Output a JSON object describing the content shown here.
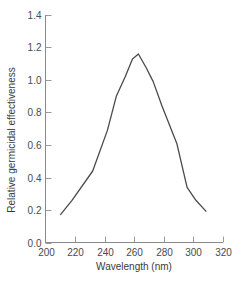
{
  "chart_data": {
    "type": "line",
    "title": "",
    "xlabel": "Wavelength (nm)",
    "ylabel": "Relative germicidal effectiveness",
    "xlim": [
      200,
      320
    ],
    "ylim": [
      0.0,
      1.4
    ],
    "x_ticks": [
      200,
      220,
      240,
      260,
      280,
      300,
      320
    ],
    "x_tick_labels": [
      "200",
      "220",
      "240",
      "260",
      "280",
      "300",
      "320"
    ],
    "y_ticks": [
      0.0,
      0.2,
      0.4,
      0.6,
      0.8,
      1.0,
      1.2,
      1.4
    ],
    "y_tick_labels": [
      "0.0",
      "0.2",
      "0.4",
      "0.6",
      "0.8",
      "1.0",
      "1.2",
      "1.4"
    ],
    "grid": false,
    "legend": null,
    "series": [
      {
        "name": "Germicidal effectiveness",
        "x": [
          210,
          218,
          232,
          242,
          248,
          254,
          259,
          263,
          268,
          273,
          279,
          289,
          296,
          302,
          309
        ],
        "y": [
          0.17,
          0.26,
          0.44,
          0.69,
          0.9,
          1.02,
          1.13,
          1.16,
          1.08,
          0.99,
          0.84,
          0.61,
          0.34,
          0.26,
          0.19
        ]
      }
    ]
  },
  "axes": {
    "x_title": "Wavelength (nm)",
    "y_title": "Relative germicidal effectiveness"
  }
}
